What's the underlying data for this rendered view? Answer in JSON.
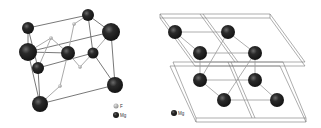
{
  "figure": {
    "left_panel": {
      "description": "Unit cell with Mg and F atoms",
      "legend": [
        {
          "label": "F",
          "color": "#9a9a9a"
        },
        {
          "label": "Mg",
          "color": "#1e1e1e"
        }
      ]
    },
    "right_panel": {
      "description": "Mg lattice in rhombohedral cells",
      "legend": [
        {
          "label": "Mg",
          "color": "#1e1e1e"
        }
      ]
    }
  }
}
